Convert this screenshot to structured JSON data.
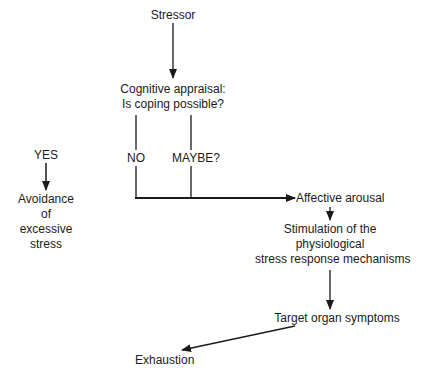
{
  "diagram": {
    "nodes": {
      "stressor": "Stressor",
      "appraisal_line1": "Cognitive appraisal:",
      "appraisal_line2": "Is coping possible?",
      "yes": "YES",
      "no": "NO",
      "maybe": "MAYBE?",
      "avoidance_line1": "Avoidance",
      "avoidance_line2": "of",
      "avoidance_line3": "excessive",
      "avoidance_line4": "stress",
      "arousal": "Affective arousal",
      "stimulation_line1": "Stimulation of the",
      "stimulation_line2": "physiological",
      "stimulation_line3": "stress response mechanisms",
      "target": "Target organ symptoms",
      "exhaustion": "Exhaustion"
    },
    "edges": [
      {
        "from": "Stressor",
        "to": "Cognitive appraisal"
      },
      {
        "from": "Cognitive appraisal",
        "to": "NO"
      },
      {
        "from": "Cognitive appraisal",
        "to": "MAYBE?"
      },
      {
        "from": "YES",
        "to": "Avoidance of excessive stress"
      },
      {
        "from": "NO",
        "to": "Affective arousal"
      },
      {
        "from": "MAYBE?",
        "to": "Affective arousal"
      },
      {
        "from": "Affective arousal",
        "to": "Stimulation of the physiological stress response mechanisms"
      },
      {
        "from": "Stimulation of the physiological stress response mechanisms",
        "to": "Target organ symptoms"
      },
      {
        "from": "Target organ symptoms",
        "to": "Exhaustion"
      }
    ],
    "colors": {
      "ink": "#1a1a1a",
      "background": "#ffffff"
    }
  }
}
